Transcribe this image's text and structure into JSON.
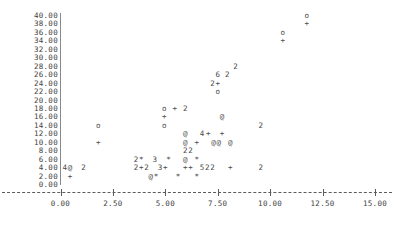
{
  "chart_data": {
    "type": "scatter",
    "title": "",
    "xlabel": "",
    "ylabel": "",
    "xlim": [
      0.0,
      15.0
    ],
    "ylim": [
      0.0,
      40.0
    ],
    "grid": false,
    "legend": null,
    "x_ticks": [
      "0.00",
      "2.50",
      "5.00",
      "7.50",
      "10.00",
      "12.50",
      "15.00"
    ],
    "x_tick_values": [
      0.0,
      2.5,
      5.0,
      7.5,
      10.0,
      12.5,
      15.0
    ],
    "y_ticks": [
      "0.00",
      "2.00",
      "4.00",
      "6.00",
      "8.00",
      "10.00",
      "12.00",
      "14.00",
      "16.00",
      "18.00",
      "20.00",
      "22.00",
      "24.00",
      "26.00",
      "28.00",
      "30.00",
      "32.00",
      "34.00",
      "36.00",
      "38.00",
      "40.00"
    ],
    "y_tick_values": [
      0,
      2,
      4,
      6,
      8,
      10,
      12,
      14,
      16,
      18,
      20,
      22,
      24,
      26,
      28,
      30,
      32,
      34,
      36,
      38,
      40
    ],
    "points": [
      {
        "x": 11.75,
        "y": 40.0,
        "glyph": "o"
      },
      {
        "x": 11.75,
        "y": 38.0,
        "glyph": "+"
      },
      {
        "x": 10.6,
        "y": 36.0,
        "glyph": "o"
      },
      {
        "x": 10.6,
        "y": 34.0,
        "glyph": "+"
      },
      {
        "x": 8.35,
        "y": 28.0,
        "glyph": "2"
      },
      {
        "x": 7.5,
        "y": 26.0,
        "glyph": "6"
      },
      {
        "x": 7.95,
        "y": 26.0,
        "glyph": "2"
      },
      {
        "x": 7.25,
        "y": 24.0,
        "glyph": "2"
      },
      {
        "x": 7.5,
        "y": 24.0,
        "glyph": "+"
      },
      {
        "x": 7.5,
        "y": 22.0,
        "glyph": "o"
      },
      {
        "x": 4.95,
        "y": 18.0,
        "glyph": "o"
      },
      {
        "x": 5.45,
        "y": 18.0,
        "glyph": "+"
      },
      {
        "x": 5.95,
        "y": 18.0,
        "glyph": "2"
      },
      {
        "x": 4.95,
        "y": 16.0,
        "glyph": "+"
      },
      {
        "x": 7.7,
        "y": 16.0,
        "glyph": "@"
      },
      {
        "x": 1.8,
        "y": 14.0,
        "glyph": "o"
      },
      {
        "x": 4.95,
        "y": 14.0,
        "glyph": "o"
      },
      {
        "x": 9.55,
        "y": 14.0,
        "glyph": "2"
      },
      {
        "x": 5.95,
        "y": 12.0,
        "glyph": "@"
      },
      {
        "x": 6.75,
        "y": 12.0,
        "glyph": "4"
      },
      {
        "x": 7.05,
        "y": 12.0,
        "glyph": "+"
      },
      {
        "x": 7.7,
        "y": 12.0,
        "glyph": "+"
      },
      {
        "x": 1.8,
        "y": 10.0,
        "glyph": "+"
      },
      {
        "x": 5.95,
        "y": 10.0,
        "glyph": "@"
      },
      {
        "x": 6.5,
        "y": 10.0,
        "glyph": "+"
      },
      {
        "x": 7.3,
        "y": 10.0,
        "glyph": "@"
      },
      {
        "x": 7.55,
        "y": 10.0,
        "glyph": "@"
      },
      {
        "x": 8.1,
        "y": 10.0,
        "glyph": "@"
      },
      {
        "x": 5.95,
        "y": 8.0,
        "glyph": "2"
      },
      {
        "x": 6.2,
        "y": 8.0,
        "glyph": "2"
      },
      {
        "x": 3.6,
        "y": 6.0,
        "glyph": "2"
      },
      {
        "x": 3.85,
        "y": 6.0,
        "glyph": "*"
      },
      {
        "x": 4.5,
        "y": 6.0,
        "glyph": "3"
      },
      {
        "x": 5.15,
        "y": 6.0,
        "glyph": "*"
      },
      {
        "x": 5.95,
        "y": 6.0,
        "glyph": "@"
      },
      {
        "x": 6.5,
        "y": 6.0,
        "glyph": "*"
      },
      {
        "x": 0.2,
        "y": 4.0,
        "glyph": "4"
      },
      {
        "x": 0.45,
        "y": 4.0,
        "glyph": "@"
      },
      {
        "x": 1.1,
        "y": 4.0,
        "glyph": "2"
      },
      {
        "x": 3.6,
        "y": 4.0,
        "glyph": "2"
      },
      {
        "x": 3.85,
        "y": 4.0,
        "glyph": "+"
      },
      {
        "x": 4.1,
        "y": 4.0,
        "glyph": "2"
      },
      {
        "x": 4.75,
        "y": 4.0,
        "glyph": "3"
      },
      {
        "x": 5.0,
        "y": 4.0,
        "glyph": "+"
      },
      {
        "x": 5.95,
        "y": 4.0,
        "glyph": "+"
      },
      {
        "x": 6.2,
        "y": 4.0,
        "glyph": "+"
      },
      {
        "x": 6.75,
        "y": 4.0,
        "glyph": "5"
      },
      {
        "x": 7.0,
        "y": 4.0,
        "glyph": "2"
      },
      {
        "x": 7.25,
        "y": 4.0,
        "glyph": "2"
      },
      {
        "x": 8.1,
        "y": 4.0,
        "glyph": "+"
      },
      {
        "x": 9.55,
        "y": 4.0,
        "glyph": "2"
      },
      {
        "x": 0.45,
        "y": 2.0,
        "glyph": "+"
      },
      {
        "x": 4.3,
        "y": 2.0,
        "glyph": "@"
      },
      {
        "x": 4.55,
        "y": 2.0,
        "glyph": "*"
      },
      {
        "x": 5.6,
        "y": 2.0,
        "glyph": "*"
      },
      {
        "x": 6.5,
        "y": 2.0,
        "glyph": "*"
      }
    ]
  },
  "colors": {
    "axis": "#5c5c5c",
    "text": "#3f3f3f",
    "marker": "#4a4a4a",
    "background": "#ffffff"
  }
}
